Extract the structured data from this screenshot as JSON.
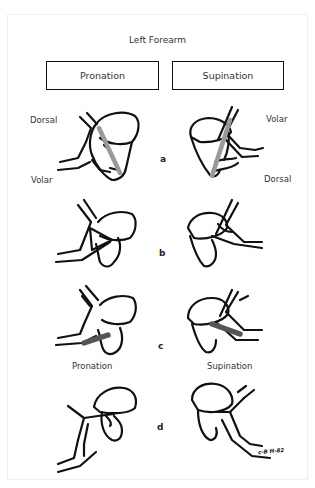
{
  "title": "Left Forearm",
  "headers": {
    "left": "Pronation",
    "right": "Supination"
  },
  "rows": [
    {
      "label": "a",
      "left_labels": [
        "Dorsal",
        "Volar"
      ],
      "right_labels": [
        "Volar",
        "Dorsal"
      ]
    },
    {
      "label": "b"
    },
    {
      "label": "c",
      "left_caption": "Pronation",
      "right_caption": "Supination"
    },
    {
      "label": "d"
    }
  ],
  "signature": "c-B H-82",
  "colors": {
    "line": "#111111",
    "rod": "#9a9a9a",
    "plate": "#555555"
  }
}
